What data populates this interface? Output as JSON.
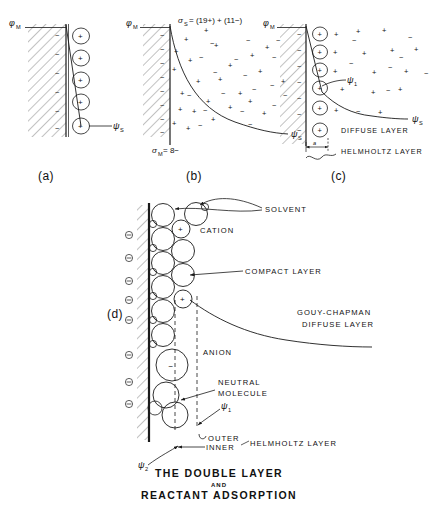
{
  "figure": {
    "title_line1": "THE DOUBLE LAYER",
    "title_line2": "AND",
    "title_line3": "REACTANT ADSORPTION",
    "panel_labels": {
      "a": "(a)",
      "b": "(b)",
      "c": "(c)",
      "d": "(d)"
    }
  },
  "symbols": {
    "phi_m": "φ",
    "phi_m_sub": "M",
    "psi": "ψ",
    "psi_s_sub": "S",
    "psi_1_sub": "1",
    "psi_2_sub": "2",
    "sigma": "σ",
    "sigma_s_sub": "S",
    "sigma_m_sub": "M",
    "plus": "+",
    "minus": "−",
    "circled_minus": "⊖",
    "gap_label": "a"
  },
  "panel_a": {
    "label": "(a)",
    "metal_potential": "φ",
    "metal_potential_sub": "M",
    "solution_potential": "ψ",
    "solution_potential_sub": "S",
    "metal_charges": [
      "−",
      "−",
      "−",
      "−",
      "−",
      "−"
    ],
    "adsorbed_ions": [
      "+",
      "+",
      "+",
      "+",
      "+"
    ],
    "description": "Helmholtz model: rigid layer of cations at the metal surface, linear potential drop"
  },
  "panel_b": {
    "label": "(b)",
    "sigma_solution": "σ",
    "sigma_solution_sub": "S",
    "sigma_solution_value": "= (19+) + (11−)",
    "sigma_metal": "σ",
    "sigma_metal_sub": "M",
    "sigma_metal_value": "= 8−",
    "solution_potential": "ψ",
    "solution_potential_sub": "S",
    "metal_potential": "φ",
    "metal_potential_sub": "M",
    "metal_charges": [
      "−",
      "−",
      "−",
      "−",
      "−",
      "−",
      "−",
      "−"
    ],
    "description": "Gouy-Chapman diffuse model: scattered ion cloud, exponential potential decay",
    "cation_count": 19,
    "anion_count": 11
  },
  "panel_c": {
    "label": "(c)",
    "metal_potential": "φ",
    "metal_potential_sub": "M",
    "psi_1": "ψ",
    "psi_1_sub": "1",
    "psi_s": "ψ",
    "psi_s_sub": "S",
    "diffuse_layer": "DIFFUSE LAYER",
    "helmholtz_layer": "HELMHOLTZ LAYER",
    "gap_label": "a",
    "metal_charges": [
      "−",
      "−",
      "−",
      "−",
      "−",
      "−",
      "−"
    ],
    "adsorbed_ions": [
      "+",
      "+",
      "+",
      "+",
      "+",
      "+"
    ],
    "description": "Stern model: compact Helmholtz layer plus diffuse layer"
  },
  "panel_d": {
    "label": "(d)",
    "annotations": {
      "solvent": "SOLVENT",
      "cation": "CATION",
      "compact_layer": "COMPACT LAYER",
      "gouy_chapman_line1": "GOUY-CHAPMAN",
      "gouy_chapman_line2": "DIFFUSE LAYER",
      "anion": "ANION",
      "neutral_line1": "NEUTRAL",
      "neutral_line2": "MOLECULE",
      "outer": "OUTER",
      "inner": "INNER",
      "helmholtz_layer": "HELMHOLTZ LAYER"
    },
    "psi_1": "ψ",
    "psi_1_sub": "1",
    "psi_2": "ψ",
    "psi_2_sub": "2",
    "metal_charges": [
      "⊖",
      "⊖",
      "⊖",
      "⊖",
      "⊖",
      "⊖",
      "⊖",
      "⊖"
    ],
    "species": [
      {
        "type": "solvent",
        "charge": ""
      },
      {
        "type": "cation",
        "charge": "+"
      },
      {
        "type": "anion",
        "charge": "−"
      },
      {
        "type": "neutral",
        "charge": ""
      }
    ],
    "description": "Detailed double layer showing solvent dipoles, specifically adsorbed ions, inner and outer Helmholtz planes"
  },
  "colors": {
    "ink": "#111111",
    "hatch": "#555555",
    "background": "#ffffff"
  }
}
